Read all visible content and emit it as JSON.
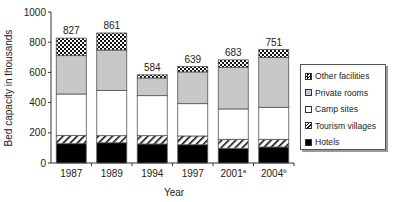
{
  "chart_data": {
    "type": "bar",
    "stacked": true,
    "title": "",
    "xlabel": "Year",
    "ylabel": "Bed capacity in thousands",
    "ylim": [
      0,
      1000
    ],
    "yticks": [
      0,
      200,
      400,
      600,
      800,
      1000
    ],
    "grid": false,
    "legend_position": "right",
    "categories": [
      "1987",
      "1989",
      "1994",
      "1997",
      "2001",
      "2004"
    ],
    "category_superscripts": [
      "",
      "",
      "",
      "",
      "a",
      "b"
    ],
    "totals": [
      827,
      861,
      584,
      639,
      683,
      751
    ],
    "series": [
      {
        "name": "Hotels",
        "pattern": "solid-black",
        "values": [
          128,
          134,
          126,
          121,
          97,
          106
        ]
      },
      {
        "name": "Tourism villages",
        "pattern": "diagonal-hatch",
        "values": [
          55,
          47,
          55,
          58,
          60,
          51
        ]
      },
      {
        "name": "Camp sites",
        "pattern": "white",
        "values": [
          274,
          300,
          265,
          214,
          201,
          212
        ]
      },
      {
        "name": "Private rooms",
        "pattern": "light-grey",
        "values": [
          254,
          267,
          117,
          210,
          276,
          331
        ]
      },
      {
        "name": "Other facilities",
        "pattern": "checkerboard",
        "values": [
          116,
          113,
          21,
          36,
          49,
          51
        ]
      }
    ]
  },
  "legend": {
    "items": [
      {
        "label": "Other facilities",
        "pattern": "checkerboard"
      },
      {
        "label": "Private rooms",
        "pattern": "light-grey"
      },
      {
        "label": "Camp sites",
        "pattern": "white"
      },
      {
        "label": "Tourism villages",
        "pattern": "diagonal-hatch"
      },
      {
        "label": "Hotels",
        "pattern": "solid-black"
      }
    ]
  },
  "colors": {
    "hotels": "#000000",
    "private_rooms": "#c8c8c8",
    "camp_sites": "#ffffff",
    "outline": "#555555"
  }
}
